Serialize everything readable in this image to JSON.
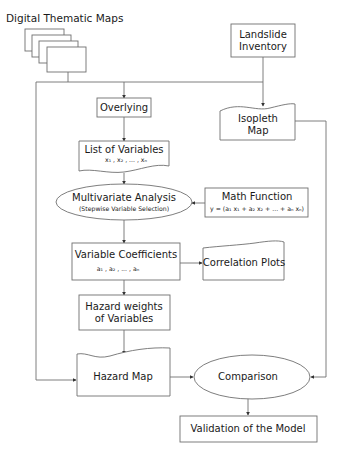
{
  "diagram": {
    "type": "flowchart",
    "colors": {
      "stroke": "#6f6f6f",
      "text": "#1a1a1a",
      "background": "#ffffff"
    },
    "nodes": {
      "digital_maps": {
        "label": "Digital Thematic Maps",
        "shape": "stacked-documents"
      },
      "landslide_inventory": {
        "line1": "Landslide",
        "line2": "Inventory",
        "shape": "rectangle"
      },
      "overlying": {
        "label": "Overlying",
        "shape": "rectangle"
      },
      "isopleth_map": {
        "line1": "Isopleth",
        "line2": "Map",
        "shape": "document"
      },
      "list_of_variables": {
        "label": "List of Variables",
        "sub": "x₁ , x₂ , ... , xₙ",
        "shape": "document"
      },
      "multivariate_analysis": {
        "label": "Multivariate Analysis",
        "sub": "(Stepwise Variable Selection)",
        "shape": "ellipse"
      },
      "math_function": {
        "label": "Math Function",
        "sub": "y = (a₁ x₁ + a₂ x₂ + ... + aₙ xₙ)",
        "shape": "rectangle"
      },
      "variable_coefficients": {
        "label": "Variable Coefficients",
        "sub": "a₁ , a₂ , ... , aₙ",
        "shape": "rectangle"
      },
      "correlation_plots": {
        "label": "Correlation Plots",
        "shape": "document"
      },
      "hazard_weights": {
        "line1": "Hazard weights",
        "line2": "of Variables",
        "shape": "rectangle"
      },
      "hazard_map": {
        "label": "Hazard Map",
        "shape": "document"
      },
      "comparison": {
        "label": "Comparison",
        "shape": "ellipse"
      },
      "validation": {
        "label": "Validation of the Model",
        "shape": "rectangle"
      }
    },
    "edges": [
      {
        "from": "Digital Thematic Maps",
        "to": "Overlying"
      },
      {
        "from": "Digital Thematic Maps",
        "to": "Hazard Map"
      },
      {
        "from": "Landslide Inventory",
        "to": "Isopleth Map"
      },
      {
        "from": "Overlying",
        "to": "List of Variables"
      },
      {
        "from": "List of Variables",
        "to": "Multivariate Analysis"
      },
      {
        "from": "Math Function",
        "to": "Multivariate Analysis"
      },
      {
        "from": "Multivariate Analysis",
        "to": "Variable Coefficients"
      },
      {
        "from": "Variable Coefficients",
        "to": "Correlation Plots"
      },
      {
        "from": "Variable Coefficients",
        "to": "Hazard weights of Variables"
      },
      {
        "from": "Hazard weights of Variables",
        "to": "Hazard Map"
      },
      {
        "from": "Hazard Map",
        "to": "Comparison"
      },
      {
        "from": "Isopleth Map",
        "to": "Comparison"
      },
      {
        "from": "Comparison",
        "to": "Validation of the Model"
      }
    ]
  }
}
